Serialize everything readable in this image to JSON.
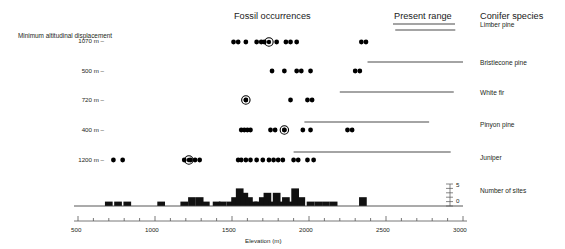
{
  "headers": {
    "fossil_occurrences": "Fossil occurrences",
    "present_range": "Present range",
    "conifer_species": "Conifer species",
    "left_axis_title": "Minimum altitudinal displacement",
    "number_of_sites": "Number of sites"
  },
  "rows": [
    {
      "species": "Limber pine",
      "displacement": "1070 m –"
    },
    {
      "species": "Bristlecone pine",
      "displacement": "500 m –"
    },
    {
      "species": "White fir",
      "displacement": "720 m –"
    },
    {
      "species": "Pinyon pine",
      "displacement": "400 m –"
    },
    {
      "species": "Juniper",
      "displacement": "1200 m –"
    }
  ],
  "xaxis": {
    "label": "Elevation (m)",
    "ticks": [
      "500",
      "1000",
      "1500",
      "2000",
      "2500",
      "3000"
    ],
    "min": 500,
    "max": 3000,
    "minor_step": 100
  },
  "site_axis": {
    "top": "5",
    "bottom": "0",
    "max": 5
  },
  "colors": {
    "dot": "#000000",
    "range_line": "#4a4a4a",
    "bar": "#111111",
    "text": "#231f20"
  },
  "chart_data": {
    "type": "scatter",
    "xlabel": "Elevation (m)",
    "ylabel": "",
    "xlim": [
      500,
      3000
    ],
    "grid": false,
    "legend": "none",
    "series": [
      {
        "name": "Limber pine",
        "minimum_altitudinal_displacement_m": 1070,
        "fossil_occurrences_m": [
          1510,
          1540,
          1590,
          1660,
          1690,
          1710,
          1790,
          1850,
          1880,
          1920,
          2340,
          2370
        ],
        "modern_site_m": [
          1740
        ],
        "present_range_m": [
          2560,
          2950
        ]
      },
      {
        "name": "Bristlecone pine",
        "minimum_altitudinal_displacement_m": 500,
        "fossil_occurrences_m": [
          1760,
          1840,
          1920,
          1950,
          2010,
          2300,
          2330
        ],
        "modern_site_m": [],
        "present_range_m": [
          2380,
          3000
        ]
      },
      {
        "name": "White fir",
        "minimum_altitudinal_displacement_m": 720,
        "fossil_occurrences_m": [
          1590,
          1880,
          1990,
          2020
        ],
        "modern_site_m": [
          1590
        ],
        "present_range_m": [
          2200,
          2940
        ]
      },
      {
        "name": "Pinyon pine",
        "minimum_altitudinal_displacement_m": 400,
        "fossil_occurrences_m": [
          1560,
          1580,
          1600,
          1620,
          1750,
          1780,
          1840,
          1960,
          2010,
          2250,
          2280
        ],
        "modern_site_m": [
          1840
        ],
        "present_range_m": [
          1970,
          2780
        ]
      },
      {
        "name": "Juniper",
        "minimum_altitudinal_displacement_m": 1200,
        "fossil_occurrences_m": [
          730,
          790,
          1190,
          1230,
          1260,
          1290,
          1540,
          1560,
          1590,
          1620,
          1660,
          1700,
          1740,
          1770,
          1800,
          1830,
          1900,
          1930,
          1990,
          2030
        ],
        "modern_site_m": [
          1220
        ],
        "present_range_m": [
          1900,
          2920
        ]
      }
    ],
    "histogram": {
      "type": "bar",
      "name": "Number of sites",
      "bin_width_m": 50,
      "ylim": [
        0,
        5
      ],
      "bins_m": [
        700,
        760,
        820,
        1040,
        1190,
        1240,
        1290,
        1330,
        1400,
        1440,
        1490,
        1520,
        1550,
        1580,
        1610,
        1640,
        1670,
        1700,
        1730,
        1760,
        1790,
        1820,
        1850,
        1880,
        1910,
        1950,
        2010,
        2060,
        2110,
        2160,
        2350
      ],
      "counts": [
        1,
        1,
        1,
        1,
        1,
        2,
        2,
        1,
        1,
        1,
        1,
        2,
        4,
        3,
        2,
        1,
        1,
        2,
        3,
        1,
        3,
        1,
        2,
        1,
        4,
        2,
        1,
        1,
        1,
        1,
        2
      ]
    }
  }
}
